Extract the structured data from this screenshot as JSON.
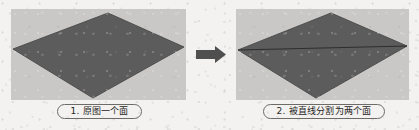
{
  "page": {
    "background_color": "#f3f2f0",
    "panel_background_color": "#c9c8c6",
    "shape_fill_color": "#5c5c5c",
    "shape_edge_color": "#4a4a4a",
    "divider_line_color": "#2e2e2e",
    "arrow_color": "#4f4f4f",
    "caption_border_color": "#6d6b68",
    "caption_text_color": "#262523"
  },
  "panels": [
    {
      "id": "original",
      "shape_name": "rhombus",
      "divided": false,
      "face_count": 1,
      "caption": "1. 原图一个面"
    },
    {
      "id": "divided",
      "shape_name": "rhombus",
      "divided": true,
      "face_count": 2,
      "caption": "2. 被直线分割为两个面"
    }
  ],
  "arrow": {
    "direction": "right",
    "icon": "arrow-right-icon"
  }
}
